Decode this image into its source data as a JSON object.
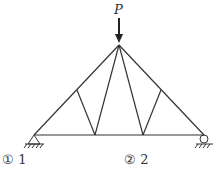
{
  "diagram": {
    "type": "truss",
    "load": {
      "label": "P",
      "direction": "down"
    },
    "nodes": {
      "left_support": [
        34,
        135
      ],
      "right_support": [
        204,
        135
      ],
      "apex": [
        119,
        45
      ],
      "upper_left": [
        77,
        90
      ],
      "upper_right": [
        161,
        90
      ],
      "bottom_left": [
        95,
        135
      ],
      "bottom_right": [
        143,
        135
      ]
    },
    "supports": {
      "left": "pin",
      "right": "roller"
    },
    "line_color": "#333333"
  },
  "options": [
    {
      "marker": "①",
      "value": "1"
    },
    {
      "marker": "②",
      "value": "2"
    }
  ]
}
